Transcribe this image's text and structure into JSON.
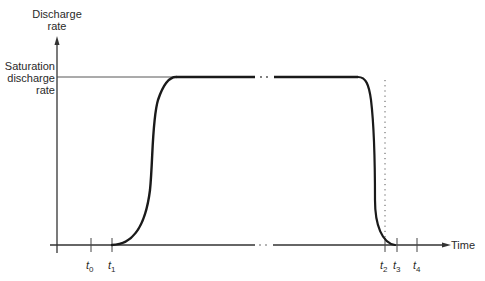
{
  "diagram": {
    "y_axis_label_line1": "Discharge",
    "y_axis_label_line2": "rate",
    "saturation_label_line1": "Saturation",
    "saturation_label_line2": "discharge",
    "saturation_label_line3": "rate",
    "x_axis_label": "Time",
    "ticks": [
      {
        "var": "t",
        "sub": "0"
      },
      {
        "var": "t",
        "sub": "1"
      },
      {
        "var": "t",
        "sub": "2"
      },
      {
        "var": "t",
        "sub": "3"
      },
      {
        "var": "t",
        "sub": "4"
      }
    ],
    "break_marker": "· ·",
    "colors": {
      "line": "#1a1a1a",
      "axis": "#333333",
      "guide": "#444444"
    }
  }
}
